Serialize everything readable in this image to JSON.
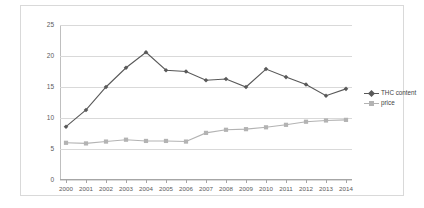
{
  "chart_data": {
    "type": "line",
    "title": "",
    "xlabel": "",
    "ylabel": "",
    "categories": [
      "2000",
      "2001",
      "2002",
      "2003",
      "2004",
      "2005",
      "2006",
      "2007",
      "2008",
      "2009",
      "2010",
      "2011",
      "2012",
      "2013",
      "2014"
    ],
    "ylim": [
      0,
      25
    ],
    "yticks": [
      0,
      5,
      10,
      15,
      20,
      25
    ],
    "grid": true,
    "legend_position": "right",
    "series": [
      {
        "name": "THC content",
        "color": "#595959",
        "marker": "diamond",
        "values": [
          8.6,
          11.3,
          15.0,
          18.1,
          20.6,
          17.7,
          17.5,
          16.1,
          16.3,
          15.0,
          17.9,
          16.6,
          15.4,
          13.6,
          14.7
        ]
      },
      {
        "name": "price",
        "color": "#b3b3b3",
        "marker": "square",
        "values": [
          6.0,
          5.9,
          6.2,
          6.5,
          6.3,
          6.3,
          6.2,
          7.6,
          8.1,
          8.2,
          8.5,
          8.9,
          9.4,
          9.6,
          9.7
        ]
      }
    ]
  },
  "legend": {
    "items": [
      {
        "label": "THC content"
      },
      {
        "label": "price"
      }
    ]
  },
  "axis": {
    "y_ticks": [
      "0",
      "5",
      "10",
      "15",
      "20",
      "25"
    ],
    "x_ticks": [
      "2000",
      "2001",
      "2002",
      "2003",
      "2004",
      "2005",
      "2006",
      "2007",
      "2008",
      "2009",
      "2010",
      "2011",
      "2012",
      "2013",
      "2014"
    ]
  },
  "colors": {
    "series_thc": "#595959",
    "series_price": "#b3b3b3",
    "gridline": "#d9d9d9",
    "border": "#d9d9d9",
    "tick_text": "#5a5a5a"
  }
}
